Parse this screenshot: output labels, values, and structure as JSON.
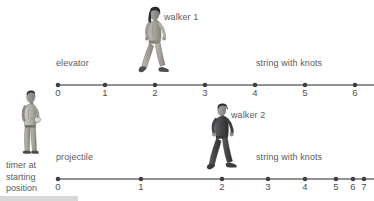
{
  "diagram": {
    "type": "physics-motion-number-lines",
    "top_track": {
      "left_label": "elevator",
      "right_label": "string with knots",
      "figure_label": "walker 1",
      "figure_name": "walker-1-person",
      "ticks": [
        {
          "value": "0",
          "x": 58
        },
        {
          "value": "1",
          "x": 105
        },
        {
          "value": "2",
          "x": 155
        },
        {
          "value": "3",
          "x": 205
        },
        {
          "value": "4",
          "x": 255
        },
        {
          "value": "5",
          "x": 305
        },
        {
          "value": "6",
          "x": 355
        }
      ],
      "axis_y": 85,
      "axis_x_start": 56,
      "axis_x_end": 374,
      "spacing": "uniform"
    },
    "bottom_track": {
      "left_label": "projectile",
      "right_label": "string with knots",
      "figure_label": "walker 2",
      "figure_name": "walker-2-person",
      "ticks": [
        {
          "value": "0",
          "x": 58
        },
        {
          "value": "1",
          "x": 141
        },
        {
          "value": "2",
          "x": 222
        },
        {
          "value": "3",
          "x": 268
        },
        {
          "value": "4",
          "x": 305
        },
        {
          "value": "5",
          "x": 336
        },
        {
          "value": "6",
          "x": 353
        },
        {
          "value": "7",
          "x": 364
        }
      ],
      "axis_y": 179,
      "axis_x_start": 56,
      "axis_x_end": 374,
      "spacing": "decreasing"
    },
    "timer": {
      "caption_lines": [
        "timer at",
        "starting",
        "position"
      ],
      "figure_name": "timer-person"
    },
    "colors": {
      "ink": "#58595b",
      "axis": "#6d6e70",
      "skin": "#8c8c8c",
      "light_cloth": "#a9a7a0",
      "dark_cloth": "#4a4a4c",
      "hair": "#2f2f31",
      "background": "#ffffff"
    }
  }
}
